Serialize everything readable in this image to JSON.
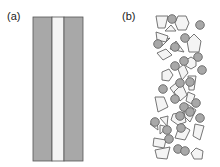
{
  "panels": [
    {
      "label": "(a)",
      "description": "layered strip: grey | white | grey"
    },
    {
      "label": "(b)",
      "description": "random packing of grey circles and white polygons"
    }
  ],
  "colors": {
    "grey_fill": "#a8a8a8",
    "stroke": "#555555",
    "white_fill": "#f4f4f4"
  }
}
